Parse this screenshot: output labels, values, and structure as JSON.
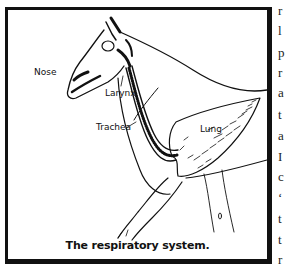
{
  "figure": {
    "labels": {
      "nose": "Nose",
      "larynx": "Larynx",
      "trachea": "Trachea",
      "lung": "Lung"
    },
    "caption": "The respiratory system."
  },
  "side_text": {
    "lines": [
      "r",
      "l",
      "p",
      "r",
      "a",
      "t",
      "a",
      "I",
      "c",
      "‘",
      "t",
      "t",
      "r"
    ]
  },
  "colors": {
    "ink": "#111111",
    "background": "#ffffff"
  }
}
